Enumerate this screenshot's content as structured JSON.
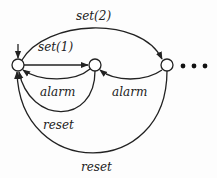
{
  "diagram": {
    "type": "state-machine",
    "nodes": [
      {
        "id": "s0",
        "initial": true
      },
      {
        "id": "s1"
      },
      {
        "id": "s2"
      }
    ],
    "continuation": "...",
    "edges": [
      {
        "from": "s0",
        "to": "s1",
        "label": "set(1)"
      },
      {
        "from": "s0",
        "to": "s2",
        "label": "set(2)"
      },
      {
        "from": "s1",
        "to": "s0",
        "label": "alarm"
      },
      {
        "from": "s2",
        "to": "s1",
        "label": "alarm"
      },
      {
        "from": "s1",
        "to": "s0",
        "label": "reset"
      },
      {
        "from": "s2",
        "to": "s0",
        "label": "reset"
      }
    ]
  },
  "colors": {
    "stroke": "#222222",
    "background": "#fdfdfd"
  }
}
